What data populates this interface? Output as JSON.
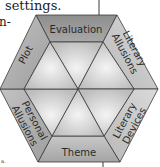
{
  "text_fragments": {
    "top": "settings.",
    "middle": "n-",
    "bottom": "a."
  },
  "diagram": {
    "shape": "hexagon",
    "segments": [
      {
        "label": "Evaluation",
        "position": "top"
      },
      {
        "label": "Literary Allusions",
        "line1": "Literary",
        "line2": "Allusions",
        "position": "top-right"
      },
      {
        "label": "Literary Devices",
        "line1": "Literary",
        "line2": "Devices",
        "position": "bottom-right"
      },
      {
        "label": "Theme",
        "position": "bottom"
      },
      {
        "label": "Personal Allusions",
        "line1": "Personal",
        "line2": "Allusions",
        "position": "bottom-left"
      },
      {
        "label": "Plot",
        "position": "top-left"
      }
    ],
    "colors": {
      "outer_dark": "#9c9c9c",
      "outer_mid": "#b4b4b4",
      "inner_light": "#e4e4e4",
      "stroke": "#3a3a3a"
    }
  }
}
